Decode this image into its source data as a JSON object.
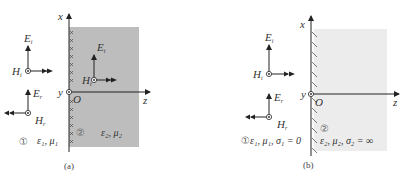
{
  "figure_a": {
    "caption": "(a)",
    "axis_x_label": "x",
    "axis_y_label": "y",
    "axis_z_label": "z",
    "origin_label": "O",
    "region1_marker": "①",
    "region1_params": "ε₁, μ₁",
    "region2_marker": "②",
    "region2_params": "ε₂, μ₂",
    "incident": {
      "E": "E",
      "E_sub": "i",
      "H": "H",
      "H_sub": "i"
    },
    "reflected": {
      "E": "E",
      "E_sub": "r",
      "H": "H",
      "H_sub": "r"
    },
    "transmitted": {
      "E": "E",
      "E_sub": "t",
      "H": "H",
      "H_sub": "t"
    },
    "region2_fill": "#bdbdbd",
    "boundary_marker": "×"
  },
  "figure_b": {
    "caption": "(b)",
    "axis_x_label": "x",
    "axis_y_label": "y",
    "axis_z_label": "z",
    "origin_label": "O",
    "region1_marker": "①",
    "region1_params": "ε₁, μ₁, σ₁ = 0",
    "region2_marker": "②",
    "region2_params": "ε₂, μ₂, σ₂ = ∞",
    "incident": {
      "E": "E",
      "E_sub": "i",
      "H": "H",
      "H_sub": "i"
    },
    "reflected": {
      "E": "E",
      "E_sub": "r",
      "H": "H",
      "H_sub": "r"
    },
    "region2_fill": "#ececec"
  }
}
